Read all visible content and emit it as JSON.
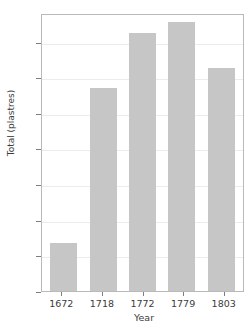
{
  "chart_data": {
    "type": "bar",
    "title": "",
    "categories": [
      "1672",
      "1718",
      "1772",
      "1779",
      "1803"
    ],
    "values": [
      27000,
      114000,
      145000,
      151000,
      125000
    ],
    "value_labels": [
      "27K",
      "114K",
      "145K",
      "151K",
      "125K"
    ],
    "xlabel": "Year",
    "ylabel": "Total (plastres)",
    "ylim": [
      0,
      156000
    ],
    "yticks": [
      0,
      20000,
      40000,
      60000,
      80000,
      100000,
      120000,
      140000
    ],
    "ytick_labels": [
      "0K",
      "20K",
      "40K",
      "60K",
      "80K",
      "100K",
      "120K",
      "140K"
    ],
    "grid": true,
    "legend": false,
    "bar_color": "#c6c6c6",
    "grid_color": "#ececec",
    "axis_color": "#b9b9b9",
    "text_color": "#3b3b3b"
  },
  "figure": {
    "clipped_title": ""
  }
}
